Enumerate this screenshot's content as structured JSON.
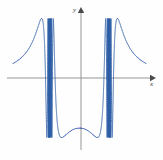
{
  "figure": {
    "width": 163,
    "height": 160,
    "background": "#fefefe"
  },
  "axes": {
    "x_axis": {
      "label": "x",
      "color": "#8a8a8a",
      "y_pixel": 78,
      "x_start_pixel": 7,
      "x_end_pixel": 152,
      "arrow": "right-arrow"
    },
    "y_axis": {
      "label": "y",
      "color": "#8a8a8a",
      "x_pixel": 81,
      "y_start_pixel": 150,
      "y_end_pixel": 10,
      "arrow": "up-arrow"
    }
  },
  "curve": {
    "color": "#2f5fa6",
    "stroke_width": 0.9,
    "style": "solid"
  },
  "chart_data": {
    "type": "line",
    "title": "",
    "xlabel": "x",
    "ylabel": "y",
    "grid": false,
    "legend": null,
    "function": "y = sin(1/(x^2 - a^2))",
    "parameter_a": 1.0,
    "xlim": [
      -2.45,
      2.45
    ],
    "ylim": [
      -1.25,
      1.25
    ],
    "x_axis_pixel_range": [
      7,
      152
    ],
    "y_axis_pixel_range": [
      140,
      21
    ],
    "x_zero_pixel": 81,
    "y_zero_pixel": 78,
    "amplitude": 1.0,
    "accumulation_points_x": [
      -1.0,
      1.0
    ],
    "accumulation_points_pixel": [
      40.3,
      121.7
    ],
    "visible_x_domain_clip": [
      -2.25,
      2.25
    ],
    "sample_count": 9000,
    "zero_crossings_x": [
      -2.16,
      -1.77,
      -1.54,
      -1.39,
      -1.29,
      -1.22,
      -1.16,
      -1.12,
      -1.09,
      -1.06,
      -1.04,
      -1.02,
      1.02,
      1.04,
      1.06,
      1.09,
      1.12,
      1.16,
      1.22,
      1.29,
      1.39,
      1.54,
      1.77,
      2.16
    ],
    "series": [
      {
        "name": "y",
        "note": "values generated analytically from function over xlim"
      }
    ]
  }
}
